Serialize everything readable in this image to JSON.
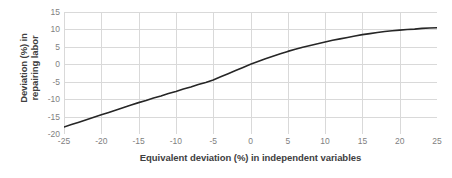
{
  "chart_data": {
    "type": "line",
    "title": "",
    "xlabel": "Equivalent deviation (%) in independent variables",
    "ylabel_line1": "Deviation (%) in",
    "ylabel_line2": "repairing labor",
    "ylabel": "Deviation (%) in repairing labor",
    "xlim": [
      -25,
      25
    ],
    "ylim": [
      -20,
      15
    ],
    "xticks": [
      -25,
      -20,
      -15,
      -10,
      -5,
      0,
      5,
      10,
      15,
      20,
      25
    ],
    "yticks": [
      15,
      10,
      5,
      0,
      -5,
      -10,
      -15,
      -20
    ],
    "xtick_labels": [
      "-25",
      "-20",
      "-15",
      "-10",
      "-5",
      "0",
      "5",
      "10",
      "15",
      "20",
      "25"
    ],
    "ytick_labels": [
      "15",
      "10",
      "5",
      "0",
      "-5",
      "-10",
      "-15",
      "-20"
    ],
    "grid": true,
    "grid_color": "#d9d9d9",
    "legend": false,
    "legend_position": "none",
    "line_color": "#262626",
    "line_width": 1.6,
    "series": [
      {
        "name": "Deviation in repairing labor",
        "x": [
          -25,
          -24,
          -23,
          -22,
          -21,
          -20,
          -19,
          -18,
          -17,
          -16,
          -15,
          -14,
          -13,
          -12,
          -11,
          -10,
          -9,
          -8,
          -7,
          -6,
          -5,
          -4,
          -3,
          -2,
          -1,
          0,
          1,
          2,
          3,
          4,
          5,
          6,
          7,
          8,
          9,
          10,
          11,
          12,
          13,
          14,
          15,
          16,
          17,
          18,
          19,
          20,
          21,
          22,
          23,
          24,
          25
        ],
        "values": [
          -18.0,
          -17.3,
          -16.6,
          -15.9,
          -15.2,
          -14.5,
          -13.8,
          -13.1,
          -12.4,
          -11.7,
          -11.0,
          -10.4,
          -9.7,
          -9.1,
          -8.4,
          -7.8,
          -7.1,
          -6.5,
          -5.8,
          -5.2,
          -4.5,
          -3.6,
          -2.7,
          -1.8,
          -0.9,
          0.0,
          0.8,
          1.6,
          2.3,
          3.0,
          3.7,
          4.3,
          4.9,
          5.4,
          5.9,
          6.4,
          6.9,
          7.3,
          7.7,
          8.1,
          8.5,
          8.8,
          9.1,
          9.4,
          9.6,
          9.8,
          10.0,
          10.1,
          10.3,
          10.4,
          10.5
        ]
      }
    ]
  }
}
